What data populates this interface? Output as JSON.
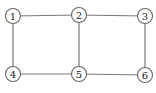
{
  "diagram": {
    "type": "graph",
    "nodes": [
      {
        "id": "1",
        "label": "1",
        "x": 13,
        "y": 16
      },
      {
        "id": "2",
        "label": "2",
        "x": 79,
        "y": 15
      },
      {
        "id": "3",
        "label": "3",
        "x": 145,
        "y": 16
      },
      {
        "id": "4",
        "label": "4",
        "x": 13,
        "y": 74
      },
      {
        "id": "5",
        "label": "5",
        "x": 79,
        "y": 74
      },
      {
        "id": "6",
        "label": "6",
        "x": 145,
        "y": 75
      }
    ],
    "edges": [
      [
        "1",
        "2"
      ],
      [
        "2",
        "3"
      ],
      [
        "1",
        "4"
      ],
      [
        "2",
        "5"
      ],
      [
        "3",
        "6"
      ],
      [
        "4",
        "5"
      ],
      [
        "5",
        "6"
      ]
    ],
    "node_radius": 7.5,
    "colors": {
      "edge": "#777777",
      "node_stroke": "#666666",
      "node_fill": "#ffffff",
      "label": "#222222"
    }
  }
}
